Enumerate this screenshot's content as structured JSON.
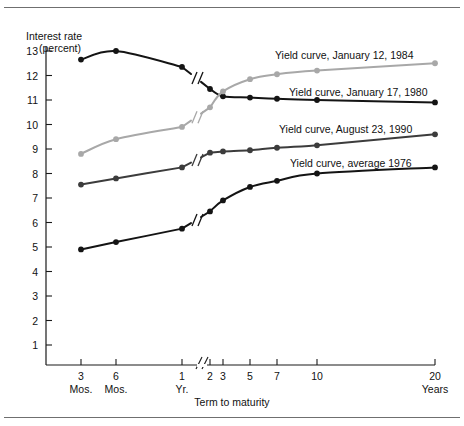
{
  "figure": {
    "y_axis_title_line1": "Interest rate",
    "y_axis_title_line2": "(percent)",
    "x_axis_title": "Term to maturity"
  },
  "chart_data": {
    "type": "line",
    "title": "",
    "xlabel": "Term to maturity",
    "ylabel": "Interest rate (percent)",
    "ylim": [
      0,
      13
    ],
    "yticks": [
      1,
      2,
      3,
      4,
      5,
      6,
      7,
      8,
      9,
      10,
      11,
      12,
      13
    ],
    "ytick_labels": [
      "1",
      "2",
      "3",
      "4",
      "5",
      "6",
      "7",
      "8",
      "9",
      "10",
      "11",
      "12",
      "13"
    ],
    "x_categories": [
      "3 Mos.",
      "6 Mos.",
      "1 Yr.",
      "2",
      "3",
      "5",
      "7",
      "10",
      "20 Years"
    ],
    "xtick_labels": [
      "3",
      "6",
      "1",
      "2",
      "3",
      "5",
      "7",
      "10",
      "20"
    ],
    "xtick_sublabels": [
      "Mos.",
      "Mos.",
      "Yr.",
      "",
      "",
      "",
      "",
      "",
      "Years"
    ],
    "axis_break": true,
    "axis_break_note": "Scale break between 1 Yr. and 2 years",
    "grid": false,
    "legend_position": "inline-right",
    "series": [
      {
        "name": "Yield curve, January 17, 1980",
        "color": "#141414",
        "label_x": 289,
        "label_y": 96,
        "values": [
          12.65,
          13.0,
          12.35,
          11.45,
          11.15,
          11.1,
          11.05,
          11.0,
          10.9
        ]
      },
      {
        "name": "Yield curve, January 12, 1984",
        "color": "#a8a8a8",
        "label_x": 275,
        "label_y": 59,
        "values": [
          8.8,
          9.4,
          9.9,
          10.7,
          11.35,
          11.85,
          12.05,
          12.2,
          12.5
        ]
      },
      {
        "name": "Yield curve, August 23, 1990",
        "color": "#3c3c3c",
        "label_x": 279,
        "label_y": 133,
        "values": [
          7.55,
          7.8,
          8.25,
          8.85,
          8.9,
          8.95,
          9.05,
          9.15,
          9.6
        ]
      },
      {
        "name": "Yield curve, average 1976",
        "color": "#141414",
        "label_x": 290,
        "label_y": 167,
        "values": [
          4.9,
          5.2,
          5.75,
          6.45,
          6.9,
          7.45,
          7.7,
          8.0,
          8.25
        ]
      }
    ]
  }
}
